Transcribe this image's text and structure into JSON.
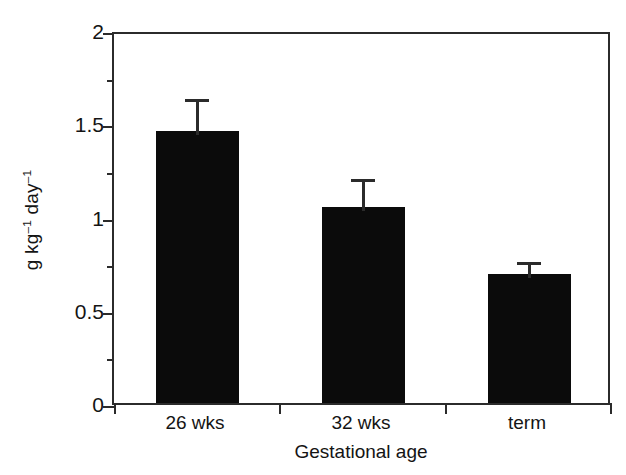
{
  "chart_data": {
    "type": "bar",
    "title": "",
    "xlabel": "Gestational age",
    "ylabel": "g kg⁻¹ day⁻¹",
    "ylabel_parts": {
      "lead": "g kg",
      "sup1": "–1",
      "mid": " day",
      "sup2": "–1"
    },
    "categories": [
      "26 wks",
      "32 wks",
      "term"
    ],
    "values": [
      1.46,
      1.05,
      0.69
    ],
    "errors": [
      0.19,
      0.17,
      0.09
    ],
    "error_type": "upper-only",
    "ylim": [
      0,
      2
    ],
    "xlim_categories": 3,
    "y_major_ticks": [
      0,
      0.5,
      1,
      1.5,
      2
    ],
    "y_major_tick_labels": [
      "0",
      "0.5",
      "1",
      "1.5",
      "2"
    ],
    "y_minor_ticks": [
      0.25,
      0.75,
      1.25,
      1.75
    ],
    "grid": false,
    "legend": null,
    "bar_color": "#0b0b0b",
    "axis_color": "#2b2b2b",
    "background_color": "#ffffff",
    "bar_width_fraction": 0.5
  },
  "figure": {
    "alt": "Bar chart of growth rate in g kg-1 day-1 by gestational age"
  }
}
